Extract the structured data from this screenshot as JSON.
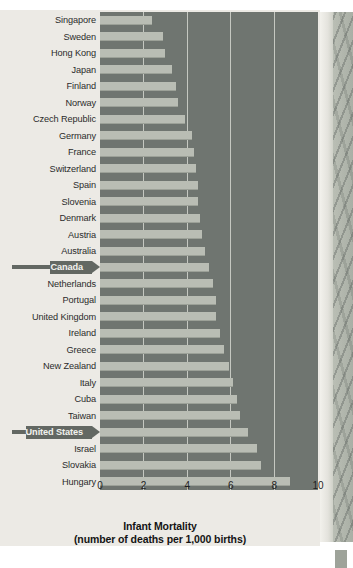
{
  "chart_data": {
    "type": "bar",
    "orientation": "horizontal",
    "title": "Infant Mortality",
    "subtitle": "(number of deaths per 1,000 births)",
    "xlabel": "Infant Mortality (number of deaths per 1,000 births)",
    "ylabel": "",
    "xlim": [
      0,
      10
    ],
    "xticks": [
      "0",
      "2",
      "4",
      "6",
      "8",
      "10"
    ],
    "xtick_values": [
      0,
      2,
      4,
      6,
      8,
      10
    ],
    "grid": true,
    "grid_axis": "x",
    "legend": "none",
    "categories": [
      "Singapore",
      "Sweden",
      "Hong Kong",
      "Japan",
      "Finland",
      "Norway",
      "Czech Republic",
      "Germany",
      "France",
      "Switzerland",
      "Spain",
      "Slovenia",
      "Denmark",
      "Austria",
      "Australia",
      "Canada",
      "Netherlands",
      "Portugal",
      "United Kingdom",
      "Ireland",
      "Greece",
      "New Zealand",
      "Italy",
      "Cuba",
      "Taiwan",
      "United States",
      "Israel",
      "Slovakia",
      "Hungary"
    ],
    "values": [
      2.4,
      2.9,
      3.0,
      3.3,
      3.5,
      3.6,
      3.9,
      4.2,
      4.3,
      4.4,
      4.5,
      4.5,
      4.6,
      4.7,
      4.8,
      5.0,
      5.2,
      5.3,
      5.3,
      5.5,
      5.7,
      5.9,
      6.1,
      6.3,
      6.4,
      6.8,
      7.2,
      7.4,
      8.7
    ],
    "highlighted": [
      "Canada",
      "United States"
    ],
    "colors": {
      "bar": "#b9bdb4",
      "plot_background": "#6f7570",
      "gridline": "#c5c8c1",
      "page_background": "#eceae5",
      "callout": "#636863",
      "callout_text": "#f2f2ee",
      "label_text": "#2b2b2b"
    }
  }
}
